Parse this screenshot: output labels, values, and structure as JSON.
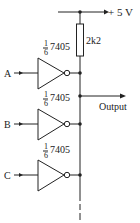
{
  "diagram": {
    "type": "circuit",
    "supply": {
      "label": "+ 5 V"
    },
    "resistor": {
      "label": "2k2"
    },
    "gates": [
      {
        "input_label": "A",
        "part_fraction_num": "1",
        "part_fraction_den": "6",
        "part_number": "7405"
      },
      {
        "input_label": "B",
        "part_fraction_num": "1",
        "part_fraction_den": "6",
        "part_number": "7405"
      },
      {
        "input_label": "C",
        "part_fraction_num": "1",
        "part_fraction_den": "6",
        "part_number": "7405"
      }
    ],
    "output": {
      "label": "Output"
    },
    "colors": {
      "ink": "#222222",
      "background": "#ffffff"
    }
  }
}
